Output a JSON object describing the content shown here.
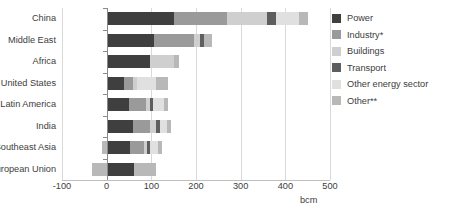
{
  "chart_data": {
    "type": "bar",
    "orientation": "horizontal",
    "stacked": true,
    "title": "",
    "subtitle": "",
    "xlabel": "bcm",
    "ylabel": "",
    "xlim": [
      -100,
      500
    ],
    "xticks": [
      -100,
      0,
      100,
      200,
      300,
      400,
      500
    ],
    "xticklabels": [
      "-100",
      "0",
      "100",
      "200",
      "300",
      "400",
      "500"
    ],
    "grid": true,
    "grid_axis": "x",
    "legend_position": "right",
    "unit": "bcm",
    "categories": [
      "China",
      "Middle East",
      "Africa",
      "United States",
      "Latin America",
      "India",
      "Southeast Asia",
      "European Union"
    ],
    "series": [
      {
        "name": "Power",
        "color": "#3f3f3f",
        "values": [
          150,
          105,
          98,
          38,
          50,
          58,
          52,
          62
        ]
      },
      {
        "name": "Industry*",
        "color": "#9a9a9a",
        "values": [
          120,
          90,
          0,
          22,
          38,
          40,
          32,
          0
        ]
      },
      {
        "name": "Buildings",
        "color": "#cfcfcf",
        "values": [
          88,
          14,
          52,
          8,
          10,
          12,
          6,
          0
        ]
      },
      {
        "name": "Transport",
        "color": "#5e5e5e",
        "values": [
          22,
          10,
          0,
          0,
          6,
          10,
          6,
          0
        ]
      },
      {
        "name": "Other energy sector",
        "color": "#e0e0e0",
        "values": [
          50,
          0,
          0,
          42,
          24,
          14,
          18,
          0
        ]
      },
      {
        "name": "Other**",
        "color": "#b8b8b8",
        "values": [
          20,
          16,
          12,
          28,
          10,
          10,
          10,
          48
        ]
      }
    ],
    "totals": [
      450,
      235,
      162,
      138,
      138,
      144,
      124,
      110
    ],
    "negative_offsets": {
      "European Union": -32,
      "Southeast Asia": -10
    }
  },
  "legend": {
    "items": [
      {
        "label": "Power",
        "color": "#3f3f3f"
      },
      {
        "label": "Industry*",
        "color": "#9a9a9a"
      },
      {
        "label": "Buildings",
        "color": "#cfcfcf"
      },
      {
        "label": "Transport",
        "color": "#5e5e5e"
      },
      {
        "label": "Other energy sector",
        "color": "#e0e0e0"
      },
      {
        "label": "Other**",
        "color": "#b8b8b8"
      }
    ]
  },
  "axis": {
    "unit_label": "bcm"
  },
  "style": {
    "gridline_color": "#d9d9d9",
    "zero_line_color": "#8a8a8a",
    "text_color": "#3d3d3d",
    "background": "#ffffff"
  }
}
